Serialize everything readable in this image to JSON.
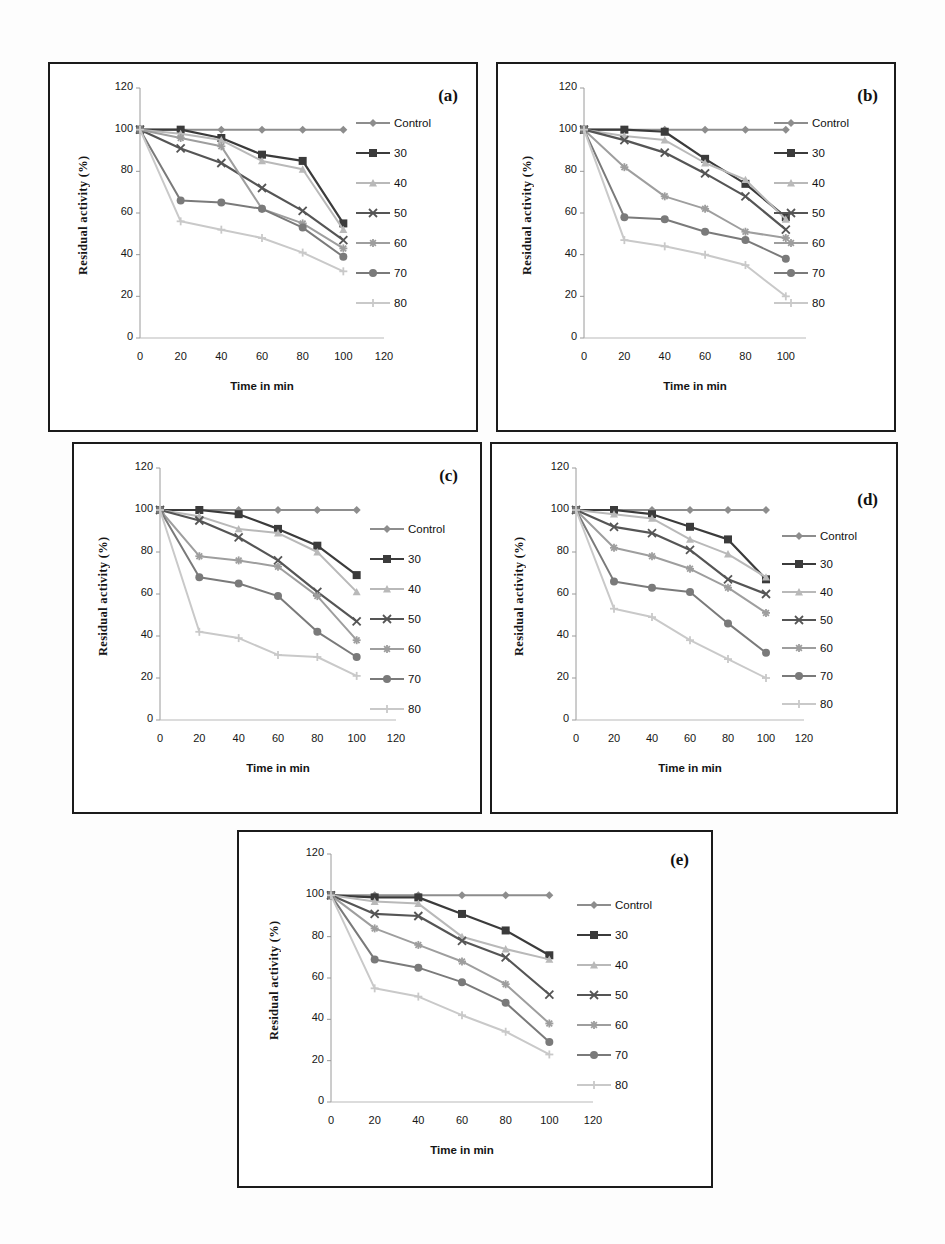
{
  "figure": {
    "panel_tags": [
      "(a)",
      "(b)",
      "(c)",
      "(d)",
      "(e)"
    ],
    "axis": {
      "ylabel": "Residual activity (%)",
      "xlabel": "Time in min",
      "yticks": [
        "0",
        "20",
        "40",
        "60",
        "80",
        "100",
        "120"
      ],
      "xticks_full": [
        "0",
        "20",
        "40",
        "60",
        "80",
        "100",
        "120"
      ],
      "xticks_short": [
        "0",
        "20",
        "40",
        "60",
        "80",
        "100"
      ]
    },
    "legend_labels": [
      "Control",
      "30",
      "40",
      "50",
      "60",
      "70",
      "80"
    ],
    "series_colors": [
      "#8d8d8d",
      "#3b3b3b",
      "#b9b9b9",
      "#555555",
      "#9e9e9e",
      "#7a7a7a",
      "#c9c9c9"
    ],
    "series_markers": [
      "diamond",
      "square",
      "triangle",
      "x",
      "asterisk",
      "circle",
      "plus"
    ]
  },
  "chart_data": [
    {
      "id": "a",
      "type": "line",
      "title": "(a)",
      "xlabel": "Time in min",
      "ylabel": "Residual activity (%)",
      "xlim": [
        0,
        120
      ],
      "ylim": [
        0,
        120
      ],
      "grid": false,
      "legend_position": "right",
      "x": [
        0,
        20,
        40,
        60,
        80,
        100
      ],
      "series": [
        {
          "name": "Control",
          "values": [
            100,
            100,
            100,
            100,
            100,
            100
          ]
        },
        {
          "name": "30",
          "values": [
            100,
            100,
            96,
            88,
            85,
            55
          ]
        },
        {
          "name": "40",
          "values": [
            100,
            98,
            95,
            85,
            81,
            52
          ]
        },
        {
          "name": "50",
          "values": [
            100,
            91,
            84,
            72,
            61,
            47
          ]
        },
        {
          "name": "60",
          "values": [
            100,
            96,
            92,
            62,
            55,
            43
          ]
        },
        {
          "name": "70",
          "values": [
            100,
            66,
            65,
            62,
            53,
            39
          ]
        },
        {
          "name": "80",
          "values": [
            100,
            56,
            52,
            48,
            41,
            32
          ]
        }
      ]
    },
    {
      "id": "b",
      "type": "line",
      "title": "(b)",
      "xlabel": "Time in min",
      "ylabel": "Residual activity (%)",
      "xlim": [
        0,
        110
      ],
      "ylim": [
        0,
        120
      ],
      "grid": false,
      "legend_position": "right",
      "x": [
        0,
        20,
        40,
        60,
        80,
        100
      ],
      "series": [
        {
          "name": "Control",
          "values": [
            100,
            100,
            100,
            100,
            100,
            100
          ]
        },
        {
          "name": "30",
          "values": [
            100,
            100,
            99,
            86,
            74,
            58
          ]
        },
        {
          "name": "40",
          "values": [
            100,
            97,
            95,
            84,
            76,
            57
          ]
        },
        {
          "name": "50",
          "values": [
            100,
            95,
            89,
            79,
            68,
            52
          ]
        },
        {
          "name": "60",
          "values": [
            100,
            82,
            68,
            62,
            51,
            48
          ]
        },
        {
          "name": "70",
          "values": [
            100,
            58,
            57,
            51,
            47,
            38
          ]
        },
        {
          "name": "80",
          "values": [
            100,
            47,
            44,
            40,
            35,
            20
          ]
        }
      ]
    },
    {
      "id": "c",
      "type": "line",
      "title": "(c)",
      "xlabel": "Time in min",
      "ylabel": "Residual activity (%)",
      "xlim": [
        0,
        120
      ],
      "ylim": [
        0,
        120
      ],
      "grid": false,
      "legend_position": "right",
      "x": [
        0,
        20,
        40,
        60,
        80,
        100
      ],
      "series": [
        {
          "name": "Control",
          "values": [
            100,
            100,
            100,
            100,
            100,
            100
          ]
        },
        {
          "name": "30",
          "values": [
            100,
            100,
            98,
            91,
            83,
            69
          ]
        },
        {
          "name": "40",
          "values": [
            100,
            97,
            91,
            89,
            80,
            61
          ]
        },
        {
          "name": "50",
          "values": [
            100,
            95,
            87,
            76,
            61,
            47
          ]
        },
        {
          "name": "60",
          "values": [
            100,
            78,
            76,
            73,
            59,
            38
          ]
        },
        {
          "name": "70",
          "values": [
            100,
            68,
            65,
            59,
            42,
            30
          ]
        },
        {
          "name": "80",
          "values": [
            100,
            42,
            39,
            31,
            30,
            21
          ]
        }
      ]
    },
    {
      "id": "d",
      "type": "line",
      "title": "(d)",
      "xlabel": "Time in min",
      "ylabel": "Residual activity (%)",
      "xlim": [
        0,
        120
      ],
      "ylim": [
        0,
        120
      ],
      "grid": false,
      "legend_position": "right",
      "x": [
        0,
        20,
        40,
        60,
        80,
        100
      ],
      "series": [
        {
          "name": "Control",
          "values": [
            100,
            100,
            100,
            100,
            100,
            100
          ]
        },
        {
          "name": "30",
          "values": [
            100,
            100,
            98,
            92,
            86,
            67
          ]
        },
        {
          "name": "40",
          "values": [
            100,
            98,
            96,
            86,
            79,
            68
          ]
        },
        {
          "name": "50",
          "values": [
            100,
            92,
            89,
            81,
            67,
            60
          ]
        },
        {
          "name": "60",
          "values": [
            100,
            82,
            78,
            72,
            63,
            51
          ]
        },
        {
          "name": "70",
          "values": [
            100,
            66,
            63,
            61,
            46,
            32
          ]
        },
        {
          "name": "80",
          "values": [
            100,
            53,
            49,
            38,
            29,
            20
          ]
        }
      ]
    },
    {
      "id": "e",
      "type": "line",
      "title": "(e)",
      "xlabel": "Time in min",
      "ylabel": "Residual activity (%)",
      "xlim": [
        0,
        120
      ],
      "ylim": [
        0,
        120
      ],
      "grid": false,
      "legend_position": "right",
      "x": [
        0,
        20,
        40,
        60,
        80,
        100
      ],
      "series": [
        {
          "name": "Control",
          "values": [
            100,
            100,
            100,
            100,
            100,
            100
          ]
        },
        {
          "name": "30",
          "values": [
            100,
            99,
            99,
            91,
            83,
            71
          ]
        },
        {
          "name": "40",
          "values": [
            100,
            97,
            96,
            80,
            74,
            69
          ]
        },
        {
          "name": "50",
          "values": [
            100,
            91,
            90,
            78,
            70,
            52
          ]
        },
        {
          "name": "60",
          "values": [
            100,
            84,
            76,
            68,
            57,
            38
          ]
        },
        {
          "name": "70",
          "values": [
            100,
            69,
            65,
            58,
            48,
            29
          ]
        },
        {
          "name": "80",
          "values": [
            100,
            55,
            51,
            42,
            34,
            23
          ]
        }
      ]
    }
  ]
}
